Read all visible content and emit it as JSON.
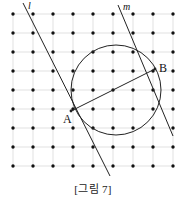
{
  "figure": {
    "caption": "[그림 7]",
    "labels": {
      "line_l": "l",
      "line_m": "m",
      "point_a": "A",
      "point_b": "B"
    },
    "colors": {
      "stroke": "#222222",
      "grid_line": "#cfcfcf",
      "dot": "#111111",
      "background": "#ffffff"
    },
    "grid": {
      "columns": 9,
      "rows": 9,
      "origin_x": 13,
      "origin_y": 14,
      "step_x": 20,
      "step_y": 19,
      "dot_radius": 1.7
    },
    "circle": {
      "cx": 116,
      "cy": 90,
      "r": 45
    },
    "lines": [
      {
        "name": "l",
        "x1": 23,
        "y1": 3,
        "x2": 110,
        "y2": 176
      },
      {
        "name": "m",
        "x1": 118,
        "y1": 5,
        "x2": 173,
        "y2": 136
      },
      {
        "name": "chord-AB",
        "x1": 71,
        "y1": 111,
        "x2": 155,
        "y2": 69
      }
    ],
    "points": [
      {
        "name": "A",
        "x": 71,
        "y": 111
      },
      {
        "name": "B",
        "x": 155,
        "y": 69
      }
    ]
  }
}
